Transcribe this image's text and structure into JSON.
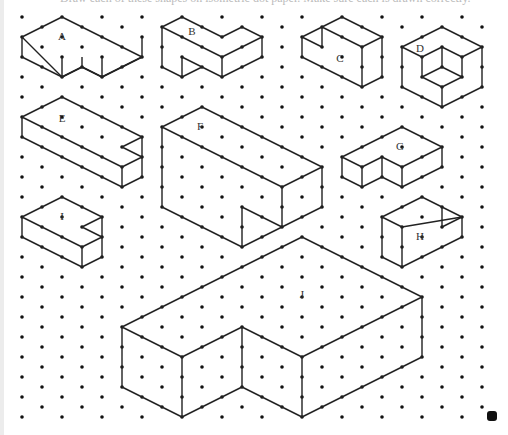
{
  "page": {
    "caption": "Draw each of these shapes on isometric dot paper. Make sure each is drawn correctly.",
    "colors": {
      "line": "#222222",
      "dot": "#111111",
      "background": "#ffffff",
      "marker": "#111111"
    }
  },
  "grid": {
    "x_start": 22,
    "x_end": 482,
    "x_step": 20,
    "even_col_y_start": 17,
    "odd_col_y_start": 27,
    "y_end": 417,
    "y_step": 20
  },
  "shapes": [
    {
      "label": "A",
      "label_pos": [
        62,
        40
      ],
      "lines": [
        [
          [
            22,
            37
          ],
          [
            62,
            17
          ],
          [
            142,
            57
          ],
          [
            102,
            77
          ],
          [
            82,
            67
          ],
          [
            62,
            77
          ],
          [
            22,
            37
          ]
        ],
        [
          [
            22,
            37
          ],
          [
            22,
            57
          ],
          [
            62,
            77
          ],
          [
            62,
            57
          ]
        ],
        [
          [
            62,
            77
          ],
          [
            82,
            67
          ],
          [
            82,
            57
          ]
        ],
        [
          [
            82,
            67
          ],
          [
            102,
            77
          ],
          [
            102,
            57
          ]
        ],
        [
          [
            102,
            77
          ],
          [
            142,
            57
          ],
          [
            142,
            37
          ]
        ]
      ]
    },
    {
      "label": "B",
      "label_pos": [
        192,
        35
      ],
      "lines": [
        [
          [
            162,
            27
          ],
          [
            182,
            17
          ],
          [
            222,
            37
          ],
          [
            242,
            27
          ],
          [
            262,
            37
          ],
          [
            222,
            57
          ],
          [
            162,
            27
          ]
        ],
        [
          [
            162,
            27
          ],
          [
            162,
            67
          ],
          [
            182,
            77
          ],
          [
            182,
            57
          ],
          [
            202,
            67
          ],
          [
            182,
            77
          ]
        ],
        [
          [
            202,
            67
          ],
          [
            222,
            77
          ],
          [
            262,
            57
          ],
          [
            262,
            37
          ]
        ],
        [
          [
            222,
            57
          ],
          [
            222,
            77
          ]
        ]
      ]
    },
    {
      "label": "C",
      "label_pos": [
        340,
        62
      ],
      "lines": [
        [
          [
            302,
            37
          ],
          [
            322,
            27
          ],
          [
            342,
            17
          ],
          [
            382,
            37
          ],
          [
            362,
            47
          ],
          [
            322,
            27
          ]
        ],
        [
          [
            302,
            37
          ],
          [
            322,
            47
          ],
          [
            322,
            27
          ]
        ],
        [
          [
            302,
            37
          ],
          [
            302,
            57
          ],
          [
            362,
            87
          ],
          [
            382,
            77
          ],
          [
            382,
            37
          ]
        ],
        [
          [
            362,
            47
          ],
          [
            362,
            87
          ]
        ]
      ]
    },
    {
      "label": "D",
      "label_pos": [
        420,
        52
      ],
      "lines": [
        [
          [
            402,
            47
          ],
          [
            442,
            27
          ],
          [
            482,
            47
          ],
          [
            482,
            87
          ],
          [
            442,
            107
          ],
          [
            402,
            87
          ],
          [
            402,
            47
          ]
        ],
        [
          [
            402,
            47
          ],
          [
            422,
            57
          ],
          [
            442,
            47
          ],
          [
            462,
            57
          ],
          [
            482,
            47
          ]
        ],
        [
          [
            422,
            57
          ],
          [
            422,
            77
          ],
          [
            442,
            87
          ],
          [
            462,
            77
          ],
          [
            462,
            57
          ]
        ],
        [
          [
            442,
            47
          ],
          [
            442,
            67
          ],
          [
            422,
            77
          ]
        ],
        [
          [
            442,
            67
          ],
          [
            462,
            77
          ]
        ],
        [
          [
            442,
            87
          ],
          [
            442,
            107
          ]
        ]
      ]
    },
    {
      "label": "E",
      "label_pos": [
        62,
        122
      ],
      "lines": [
        [
          [
            22,
            117
          ],
          [
            62,
            97
          ],
          [
            142,
            137
          ],
          [
            122,
            147
          ],
          [
            142,
            157
          ],
          [
            122,
            167
          ],
          [
            22,
            117
          ]
        ],
        [
          [
            22,
            117
          ],
          [
            22,
            137
          ],
          [
            122,
            187
          ],
          [
            142,
            177
          ],
          [
            142,
            137
          ]
        ],
        [
          [
            122,
            167
          ],
          [
            122,
            187
          ]
        ]
      ]
    },
    {
      "label": "F",
      "label_pos": [
        200,
        130
      ],
      "lines": [
        [
          [
            162,
            127
          ],
          [
            202,
            107
          ],
          [
            322,
            167
          ],
          [
            282,
            187
          ],
          [
            162,
            127
          ]
        ],
        [
          [
            162,
            127
          ],
          [
            162,
            207
          ],
          [
            242,
            247
          ],
          [
            242,
            207
          ],
          [
            282,
            227
          ],
          [
            282,
            187
          ]
        ],
        [
          [
            242,
            247
          ],
          [
            282,
            227
          ],
          [
            322,
            207
          ],
          [
            322,
            167
          ]
        ]
      ]
    },
    {
      "label": "G",
      "label_pos": [
        400,
        150
      ],
      "lines": [
        [
          [
            342,
            157
          ],
          [
            402,
            127
          ],
          [
            442,
            147
          ],
          [
            402,
            167
          ],
          [
            382,
            157
          ],
          [
            362,
            167
          ],
          [
            342,
            157
          ]
        ],
        [
          [
            342,
            157
          ],
          [
            342,
            177
          ],
          [
            362,
            187
          ],
          [
            382,
            177
          ],
          [
            402,
            187
          ],
          [
            442,
            167
          ],
          [
            442,
            147
          ]
        ],
        [
          [
            362,
            167
          ],
          [
            362,
            187
          ]
        ],
        [
          [
            382,
            157
          ],
          [
            382,
            177
          ]
        ],
        [
          [
            402,
            167
          ],
          [
            402,
            187
          ]
        ]
      ]
    },
    {
      "label": "H",
      "label_pos": [
        420,
        240
      ],
      "lines": [
        [
          [
            382,
            217
          ],
          [
            422,
            197
          ],
          [
            442,
            207
          ],
          [
            462,
            217
          ],
          [
            402,
            227
          ],
          [
            382,
            217
          ]
        ],
        [
          [
            442,
            207
          ],
          [
            442,
            227
          ],
          [
            462,
            217
          ]
        ],
        [
          [
            382,
            217
          ],
          [
            382,
            257
          ],
          [
            402,
            267
          ],
          [
            462,
            237
          ],
          [
            462,
            217
          ]
        ],
        [
          [
            402,
            227
          ],
          [
            402,
            267
          ]
        ]
      ]
    },
    {
      "label": "I",
      "label_pos": [
        62,
        220
      ],
      "lines": [
        [
          [
            22,
            217
          ],
          [
            62,
            197
          ],
          [
            102,
            217
          ],
          [
            82,
            227
          ],
          [
            102,
            237
          ],
          [
            82,
            247
          ],
          [
            22,
            217
          ]
        ],
        [
          [
            22,
            217
          ],
          [
            22,
            237
          ],
          [
            82,
            267
          ],
          [
            102,
            257
          ],
          [
            102,
            217
          ]
        ],
        [
          [
            82,
            247
          ],
          [
            82,
            267
          ]
        ]
      ]
    },
    {
      "label": "J",
      "label_pos": [
        302,
        298
      ],
      "lines": [
        [
          [
            122,
            327
          ],
          [
            302,
            237
          ],
          [
            422,
            297
          ],
          [
            302,
            357
          ],
          [
            242,
            327
          ],
          [
            182,
            357
          ],
          [
            122,
            327
          ]
        ],
        [
          [
            122,
            327
          ],
          [
            122,
            387
          ],
          [
            182,
            417
          ],
          [
            242,
            387
          ],
          [
            302,
            417
          ],
          [
            422,
            357
          ],
          [
            422,
            297
          ]
        ],
        [
          [
            182,
            357
          ],
          [
            182,
            417
          ]
        ],
        [
          [
            242,
            327
          ],
          [
            242,
            387
          ]
        ],
        [
          [
            302,
            357
          ],
          [
            302,
            417
          ]
        ]
      ]
    }
  ]
}
